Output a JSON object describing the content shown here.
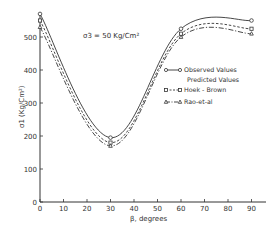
{
  "chart_data": {
    "type": "line",
    "title": "",
    "annotation": "σ3 = 50 Kg/Cm²",
    "xlabel": "β, degrees",
    "ylabel": "σ1 (Kg/Cm²)",
    "xlim": [
      0,
      95
    ],
    "ylim": [
      0,
      600
    ],
    "xticks": [
      0,
      10,
      20,
      30,
      40,
      50,
      60,
      70,
      80,
      90
    ],
    "yticks": [
      0,
      100,
      200,
      300,
      400,
      500
    ],
    "grid": false,
    "legend_position": "right-middle",
    "x": [
      0,
      30,
      60,
      90
    ],
    "series": [
      {
        "name": "Observed Values",
        "style": "solid",
        "marker": "circle",
        "values": [
          570,
          195,
          525,
          550
        ]
      },
      {
        "name": "Hoek - Brown",
        "style": "dashed",
        "marker": "square",
        "values": [
          550,
          180,
          510,
          525
        ]
      },
      {
        "name": "Rao-et-al",
        "style": "dash-dot",
        "marker": "triangle",
        "values": [
          530,
          170,
          500,
          510
        ]
      }
    ],
    "legend": {
      "observed": "Observed Values",
      "predicted_header": "Predicted Values",
      "hoek": "Hoek - Brown",
      "rao": "Rao-et-al"
    }
  }
}
